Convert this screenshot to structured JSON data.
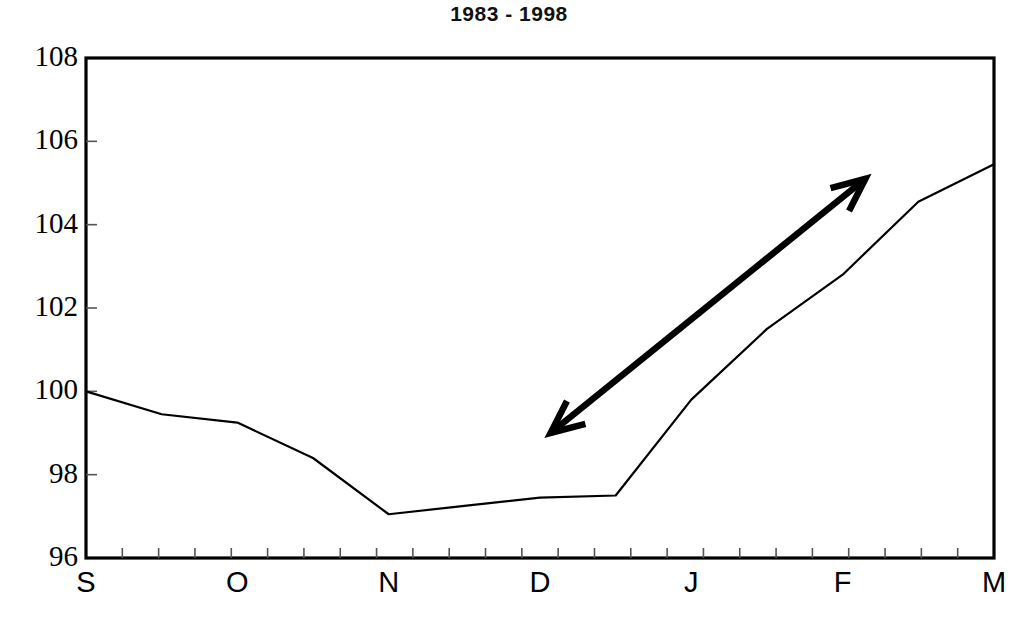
{
  "chart_data": {
    "type": "line",
    "title": "1983 - 1998",
    "xlabel": "",
    "ylabel": "",
    "ylim": [
      96,
      108
    ],
    "yticks": [
      96,
      98,
      100,
      102,
      104,
      106,
      108
    ],
    "ytick_labels": [
      "96",
      "98",
      "100",
      "102",
      "104",
      "106",
      "108"
    ],
    "categories": [
      "S",
      "O",
      "N",
      "D",
      "J",
      "F",
      "M"
    ],
    "xtick_labels": [
      "S",
      "O",
      "N",
      "D",
      "J",
      "F",
      "M"
    ],
    "grid": false,
    "legend": "none",
    "series": [
      {
        "name": "index",
        "x": [
          0.0,
          0.5,
          1.0,
          1.5,
          2.0,
          2.5,
          3.0,
          3.5,
          4.0,
          4.5,
          5.0,
          5.5,
          6.0
        ],
        "values": [
          100.0,
          99.45,
          99.25,
          98.4,
          97.05,
          97.25,
          97.45,
          97.5,
          99.8,
          101.5,
          102.8,
          104.55,
          105.45
        ]
      }
    ],
    "annotations": [
      {
        "type": "double-headed-arrow",
        "from_x": 3.07,
        "from_y": 99.0,
        "to_x": 5.15,
        "to_y": 105.1
      }
    ]
  },
  "plot_geometry": {
    "left": 86,
    "right": 994,
    "top": 58,
    "bottom": 558,
    "x_tick_count": 25
  },
  "axes": {
    "y_label_x_right": 78,
    "x_label_y": 568
  }
}
